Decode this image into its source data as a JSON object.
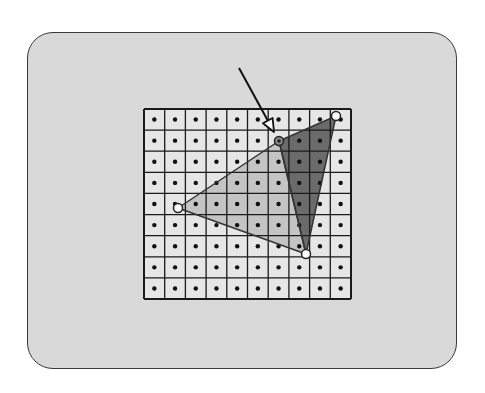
{
  "diagram": {
    "colors": {
      "panel_bg": "#d9d9d9",
      "cell_bg": "#e6e6e6",
      "grid_line": "#1a1a1a",
      "sample_dot": "#111111",
      "light_triangle": "#c4c4c4",
      "dark_triangle": "#6b6b6b",
      "edge": "#333333",
      "vertex_fill": "#ffffff"
    },
    "grid": {
      "columns": 10,
      "rows": 9,
      "x": 144,
      "y": 109,
      "width": 207,
      "height": 190
    },
    "triangles": [
      {
        "name": "light-triangle",
        "fill": "light",
        "vertices": [
          [
            279,
            141
          ],
          [
            178,
            208
          ],
          [
            306,
            254
          ]
        ]
      },
      {
        "name": "dark-triangle",
        "fill": "dark",
        "vertices": [
          [
            279,
            141
          ],
          [
            336,
            116
          ],
          [
            306,
            254
          ]
        ]
      }
    ],
    "vertices": [
      {
        "name": "shared-top-vertex",
        "x": 279,
        "y": 141,
        "highlighted": true
      },
      {
        "name": "top-right-vertex",
        "x": 336,
        "y": 116,
        "highlighted": false
      },
      {
        "name": "left-vertex",
        "x": 178,
        "y": 208,
        "highlighted": false
      },
      {
        "name": "bottom-vertex",
        "x": 306,
        "y": 254,
        "highlighted": false
      }
    ],
    "arrow": {
      "from": [
        239,
        68
      ],
      "to": [
        274,
        132
      ],
      "points_to": "shared-top-vertex"
    }
  }
}
